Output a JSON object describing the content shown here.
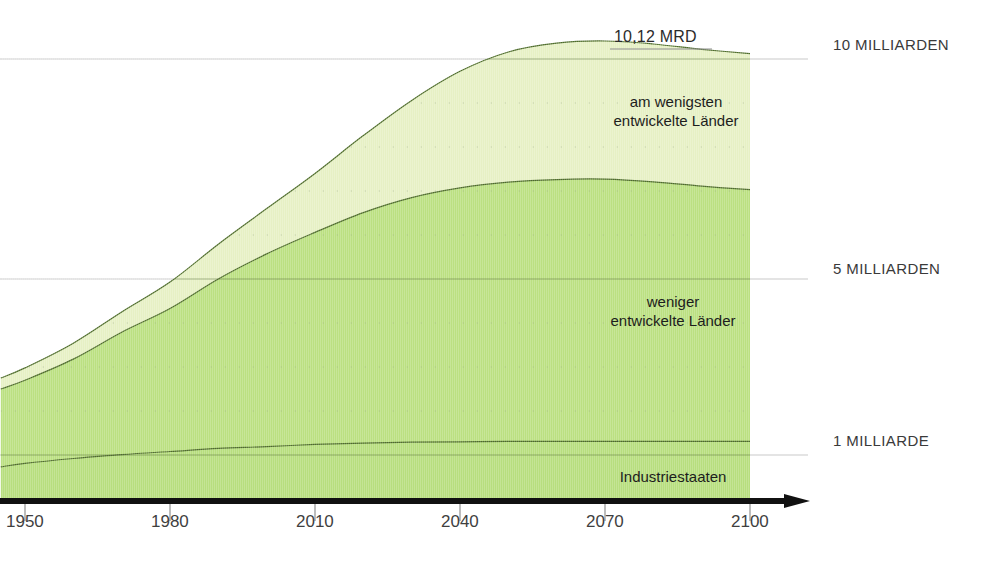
{
  "chart_data": {
    "type": "area",
    "title": "",
    "subtitle": "",
    "xlabel": "",
    "ylabel": "",
    "stacked": true,
    "grid": true,
    "legend_position": "inline-annotations",
    "xlim": [
      1945,
      2112
    ],
    "ylim": [
      0,
      11.2
    ],
    "x_tick_labels": [
      "1950",
      "1980",
      "2010",
      "2040",
      "2070",
      "2100"
    ],
    "x_ticks": [
      1950,
      1980,
      2010,
      2040,
      2070,
      2100
    ],
    "y_gridline_labels": [
      "10 MILLIARDEN",
      "5 MILLIARDEN",
      "1 MILLIARDE"
    ],
    "y_gridline_values": [
      10,
      5,
      1
    ],
    "y_minor_gridlines": [
      2,
      3,
      4,
      6,
      7,
      8,
      9
    ],
    "units": "Milliarden Menschen",
    "annotations": [
      {
        "name": "peak-total",
        "text": "10,12 MRD",
        "x": 2075,
        "y": 10.12
      }
    ],
    "data_extent_end_year": 2100,
    "x": [
      1945,
      1950,
      1960,
      1970,
      1980,
      1990,
      2000,
      2010,
      2020,
      2030,
      2040,
      2050,
      2060,
      2070,
      2080,
      2090,
      2100
    ],
    "series": [
      {
        "name": "Industriestaaten",
        "label": "Industriestaaten",
        "color": "#b7de7e",
        "line_color": "#4d6b2a",
        "values": [
          0.73,
          0.81,
          0.92,
          1.01,
          1.08,
          1.15,
          1.19,
          1.24,
          1.27,
          1.29,
          1.3,
          1.31,
          1.31,
          1.31,
          1.31,
          1.31,
          1.31
        ]
      },
      {
        "name": "weniger-entwickelte-laender",
        "label": "weniger\nentwickelte Länder",
        "label_line1": "weniger",
        "label_line2": "entwickelte Länder",
        "color": "#bbe081",
        "line_color": "#4d6b2a",
        "values": [
          1.77,
          1.89,
          2.26,
          2.78,
          3.25,
          3.85,
          4.38,
          4.82,
          5.24,
          5.56,
          5.77,
          5.89,
          5.95,
          5.96,
          5.9,
          5.8,
          5.72
        ]
      },
      {
        "name": "am-wenigsten-entwickelte-laender",
        "label": "am wenigsten\nentwickelte Länder",
        "label_line1": "am wenigsten",
        "label_line2": "entwickelte Länder",
        "color": "#e6f0c4",
        "line_color": "#4d6b2a",
        "values": [
          0.25,
          0.28,
          0.36,
          0.46,
          0.6,
          0.79,
          1.03,
          1.34,
          1.75,
          2.21,
          2.65,
          2.96,
          3.1,
          3.14,
          3.13,
          3.11,
          3.09
        ]
      }
    ],
    "totals": [
      2.75,
      2.98,
      3.54,
      4.25,
      4.93,
      5.79,
      6.6,
      7.4,
      8.26,
      9.06,
      9.72,
      10.16,
      10.36,
      10.41,
      10.34,
      10.22,
      10.12
    ]
  },
  "colors": {
    "band_top": "#e6f0c4",
    "band_middle": "#bbe081",
    "band_bottom": "#b7de7e",
    "band_line": "#4d6b2a",
    "axis_black": "#111111",
    "gridline": "#c9c9c9",
    "minor_dot": "#9aa98b",
    "left_axis": "#b5b5b5",
    "text": "#1c1c1c"
  },
  "axis": {
    "arrow_icon": "arrow-right-icon",
    "baseline_name": "x-axis-baseline",
    "left_axis_name": "y-axis-line"
  }
}
